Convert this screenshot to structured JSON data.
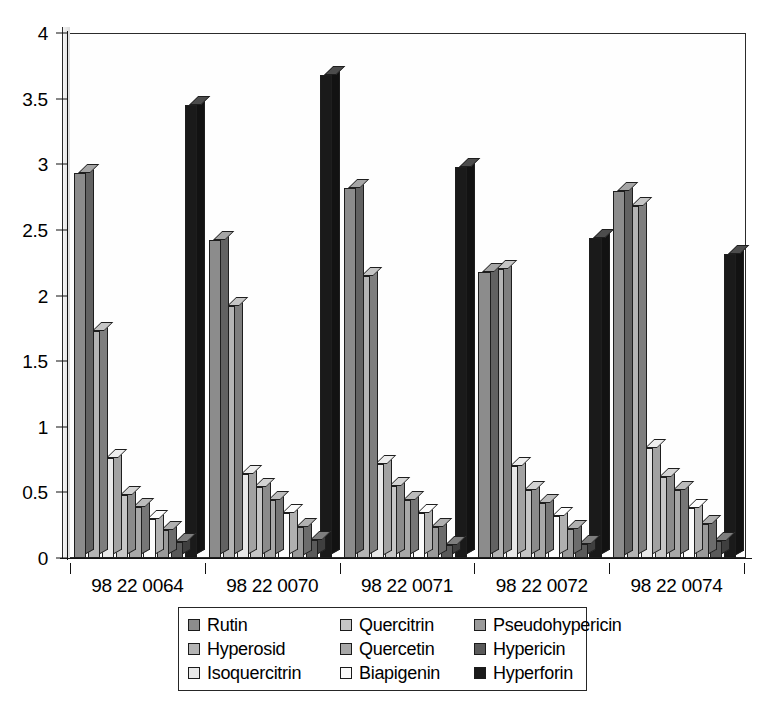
{
  "chart_data": {
    "type": "bar",
    "title": "",
    "xlabel": "",
    "ylabel": "",
    "ylim": [
      0,
      4
    ],
    "ytick_labels": [
      "0",
      "0.5",
      "1",
      "1.5",
      "2",
      "2.5",
      "3",
      "3.5",
      "4"
    ],
    "ytick_values": [
      0,
      0.5,
      1,
      1.5,
      2,
      2.5,
      3,
      3.5,
      4
    ],
    "grid": false,
    "legend_position": "bottom-center",
    "style": "3d-clustered-column",
    "categories": [
      "98 22 0064",
      "98 22 0070",
      "98 22 0071",
      "98 22 0072",
      "98 22 0074"
    ],
    "series": [
      {
        "name": "Rutin",
        "color": "#8c8c8c",
        "values": [
          2.93,
          2.42,
          2.82,
          2.18,
          2.8
        ]
      },
      {
        "name": "Hyperosid",
        "color": "#b4b4b4",
        "values": [
          1.73,
          1.92,
          2.15,
          2.2,
          2.68
        ]
      },
      {
        "name": "Isoquercitrin",
        "color": "#e8e8e8",
        "values": [
          0.76,
          0.64,
          0.72,
          0.7,
          0.84
        ]
      },
      {
        "name": "Quercitrin",
        "color": "#c6c6c6",
        "values": [
          0.48,
          0.54,
          0.55,
          0.52,
          0.62
        ]
      },
      {
        "name": "Quercetin",
        "color": "#a8a8a8",
        "values": [
          0.39,
          0.44,
          0.44,
          0.42,
          0.52
        ]
      },
      {
        "name": "Biapigenin",
        "color": "#fbfbfb",
        "values": [
          0.3,
          0.34,
          0.34,
          0.32,
          0.38
        ]
      },
      {
        "name": "Pseudohypericin",
        "color": "#9a9a9a",
        "values": [
          0.21,
          0.24,
          0.24,
          0.22,
          0.26
        ]
      },
      {
        "name": "Hypericin",
        "color": "#5a5a5a",
        "values": [
          0.12,
          0.14,
          0.1,
          0.11,
          0.13
        ]
      },
      {
        "name": "Hyperforin",
        "color": "#1a1a1a",
        "values": [
          3.45,
          3.68,
          2.98,
          2.44,
          2.32
        ]
      }
    ]
  },
  "legend": {
    "items": [
      {
        "label": "Rutin",
        "color": "#8c8c8c"
      },
      {
        "label": "Quercitrin",
        "color": "#c6c6c6"
      },
      {
        "label": "Pseudohypericin",
        "color": "#9a9a9a"
      },
      {
        "label": "Hyperosid",
        "color": "#b4b4b4"
      },
      {
        "label": "Quercetin",
        "color": "#a8a8a8"
      },
      {
        "label": "Hypericin",
        "color": "#5a5a5a"
      },
      {
        "label": "Isoquercitrin",
        "color": "#e8e8e8"
      },
      {
        "label": "Biapigenin",
        "color": "#fbfbfb"
      },
      {
        "label": "Hyperforin",
        "color": "#1a1a1a"
      }
    ]
  }
}
